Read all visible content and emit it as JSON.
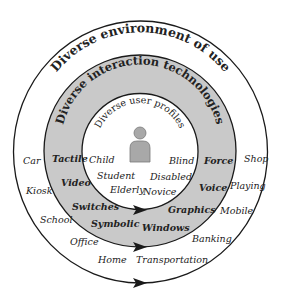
{
  "diagram": {
    "colors": {
      "background": "#ffffff",
      "ring_fill": "#c9c9c9",
      "stroke": "#1a1a1a",
      "icon_fill": "#a8a8a8",
      "icon_stroke": "#7a7a7a",
      "text": "#222222"
    },
    "outer_ring": {
      "title": "Diverse environment of use",
      "items": [
        "Car",
        "Kiosk",
        "School",
        "Office",
        "Home",
        "Transportation",
        "Banking",
        "Mobile",
        "Playing",
        "Shop"
      ]
    },
    "middle_ring": {
      "title": "Diverse interaction technologies",
      "items": [
        "Tactile",
        "Video",
        "Switches",
        "Symbolic",
        "Windows",
        "Graphics",
        "Voice",
        "Force"
      ]
    },
    "inner_circle": {
      "title": "Diverse user profiles",
      "icon": "person-icon",
      "items": [
        "Child",
        "Student",
        "Elderly",
        "Novice",
        "Disabled",
        "Blind"
      ]
    },
    "arrows": [
      "arrow-right-icon",
      "arrow-right-icon",
      "arrow-right-icon"
    ]
  }
}
